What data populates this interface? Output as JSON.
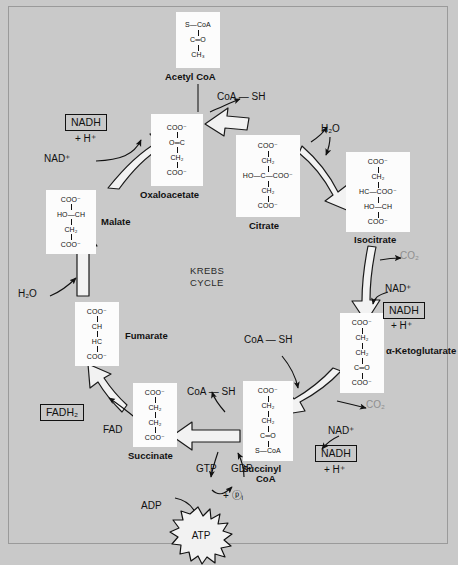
{
  "diagram": {
    "center_label_line1": "KREBS",
    "center_label_line2": "CYCLE",
    "background_color": "#c9c9c9",
    "molecule_box_color": "#fcfcfc",
    "stroke_color": "#111111"
  },
  "molecules": [
    {
      "id": "acetyl-coa",
      "name": "Acetyl CoA",
      "lines": [
        "S—CoA",
        "C═O",
        "CH₃"
      ]
    },
    {
      "id": "oxaloacetate",
      "name": "Oxaloacetate",
      "lines": [
        "COO⁻",
        "O═C",
        "CH₂",
        "COO⁻"
      ]
    },
    {
      "id": "citrate",
      "name": "Citrate",
      "lines": [
        "COO⁻",
        "CH₂",
        "HO—C—COO⁻",
        "CH₂",
        "COO⁻"
      ]
    },
    {
      "id": "isocitrate",
      "name": "Isocitrate",
      "lines": [
        "COO⁻",
        "CH₂",
        "HC—COO⁻",
        "HO—CH",
        "COO⁻"
      ]
    },
    {
      "id": "alpha-ketoglutarate",
      "name": "α-Ketoglutarate",
      "lines": [
        "COO⁻",
        "CH₂",
        "CH₂",
        "C═O",
        "COO⁻"
      ]
    },
    {
      "id": "succinyl-coa",
      "name": "Succinyl CoA",
      "name_line1": "Succinyl",
      "name_line2": "CoA",
      "lines": [
        "COO⁻",
        "CH₂",
        "CH₂",
        "C═O",
        "S—CoA"
      ]
    },
    {
      "id": "succinate",
      "name": "Succinate",
      "lines": [
        "COO⁻",
        "CH₂",
        "CH₂",
        "COO⁻"
      ]
    },
    {
      "id": "fumarate",
      "name": "Fumarate",
      "lines": [
        "COO⁻",
        "CH",
        "HC",
        "COO⁻"
      ]
    },
    {
      "id": "malate",
      "name": "Malate",
      "lines": [
        "COO⁻",
        "HO—CH",
        "CH₂",
        "COO⁻"
      ]
    }
  ],
  "cofactors": {
    "coa_sh_top": "CoA — SH",
    "coa_sh_succinyl": "CoA — SH",
    "coa_sh_succinate": "CoA — SH",
    "nad_plus_oaa": "NAD⁺",
    "nad_plus_isocitrate": "NAD⁺",
    "nad_plus_akg": "NAD⁺",
    "nadh_oaa": "NADH",
    "nadh_isocitrate": "NADH",
    "nadh_akg": "NADH",
    "h_plus_oaa": "+ H⁺",
    "h_plus_isocitrate": "+ H⁺",
    "h_plus_akg": "+ H⁺",
    "co2_isocitrate": "CO₂",
    "co2_akg": "CO₂",
    "h2o_citrate": "H₂O",
    "h2o_fumarate": "H₂O",
    "fad": "FAD",
    "fadh2": "FADH₂",
    "gtp": "GTP",
    "gdp": "GDP",
    "adp": "ADP",
    "atp": "ATP",
    "phosphate": "+ ⓟᵢ"
  }
}
